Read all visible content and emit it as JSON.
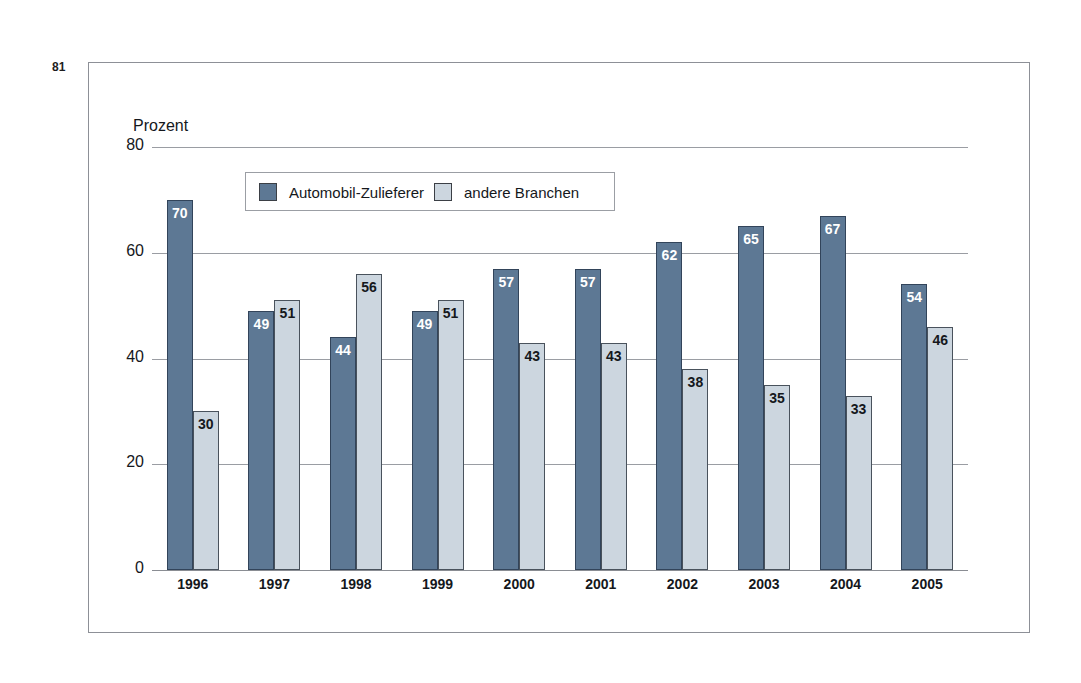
{
  "page": {
    "folio": "81"
  },
  "chart_data": {
    "type": "bar",
    "title": "",
    "subtitle": "",
    "xlabel": "",
    "ylabel": "Prozent",
    "ylim": [
      0,
      80
    ],
    "yticks": [
      "0",
      "20",
      "40",
      "60",
      "80"
    ],
    "grid": true,
    "legend_position": "top-left-inside",
    "categories": [
      "1996",
      "1997",
      "1998",
      "1999",
      "2000",
      "2001",
      "2002",
      "2003",
      "2004",
      "2005"
    ],
    "series": [
      {
        "name": "Automobil-Zulieferer",
        "color": "#5d7894",
        "values": [
          70,
          49,
          44,
          49,
          57,
          57,
          62,
          65,
          67,
          54
        ]
      },
      {
        "name": "andere Branchen",
        "color": "#ccd6df",
        "values": [
          30,
          51,
          56,
          51,
          43,
          43,
          38,
          35,
          33,
          46
        ]
      }
    ]
  }
}
